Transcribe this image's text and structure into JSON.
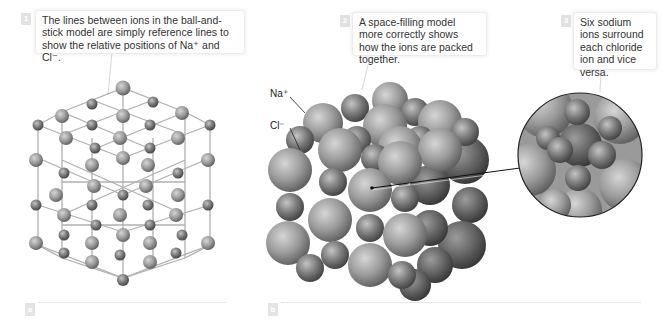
{
  "callouts": [
    {
      "number": "1",
      "text": "The lines between ions in the ball-and-stick model are simply reference lines to show the relative positions of Na⁺ and Cl⁻."
    },
    {
      "number": "2",
      "text": "A space-filling model more correctly shows how the ions are packed together."
    },
    {
      "number": "3",
      "text": "Six sodium ions surround each chloride ion and vice versa."
    }
  ],
  "ion_labels": {
    "sodium": "Na⁺",
    "chloride": "Cl⁻"
  },
  "panels": [
    {
      "label": "a",
      "description": "ball-and-stick model of NaCl lattice"
    },
    {
      "label": "b",
      "description": "space-filling model of NaCl lattice with magnified inset"
    }
  ],
  "colors": {
    "sphere_light": "#c9c9c9",
    "sphere_mid": "#8f8f8f",
    "sphere_dark": "#4a4a4a",
    "stick": "#b0b0b0",
    "callout_border": "#ececec",
    "label_box": "#e2e2e2"
  }
}
